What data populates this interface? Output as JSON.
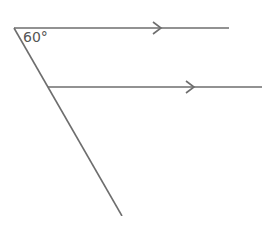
{
  "diagram": {
    "angle_label": "60°",
    "colors": {
      "line": "#6e6e6e",
      "text": "#555555",
      "background": "#ffffff"
    },
    "lines": [
      {
        "name": "upper-parallel-line",
        "x1": 14,
        "y1": 28,
        "x2": 229,
        "y2": 28,
        "arrow_at_x": 160
      },
      {
        "name": "lower-parallel-line",
        "x1": 48,
        "y1": 87,
        "x2": 262,
        "y2": 87,
        "arrow_at_x": 193
      },
      {
        "name": "transversal",
        "x1": 14,
        "y1": 28,
        "x2": 122,
        "y2": 216
      }
    ]
  }
}
